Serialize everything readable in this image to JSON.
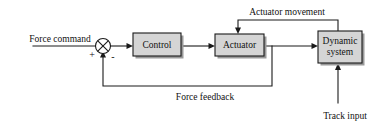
{
  "diagram": {
    "colors": {
      "block_fill": "#d5d5d5",
      "block_border": "#1a1a1a",
      "shadow": "#9a9a9a",
      "wire": "#1a1a1a",
      "background": "#ffffff",
      "text": "#111111"
    },
    "blocks": [
      {
        "id": "control",
        "label": "Control",
        "x": 133,
        "y": 33,
        "w": 48,
        "h": 23
      },
      {
        "id": "actuator",
        "label": "Actuator",
        "x": 215,
        "y": 34,
        "w": 49,
        "h": 22
      },
      {
        "id": "dynamic",
        "label_line1": "Dynamic",
        "label_line2": "system",
        "x": 318,
        "y": 31,
        "w": 44,
        "h": 32
      }
    ],
    "summing_junction": {
      "id": "sum",
      "cx": 103,
      "cy": 46,
      "r": 7.5,
      "glyph": "cross-circle",
      "input_sign_left": "+",
      "input_sign_bottom": "-"
    },
    "labels": {
      "force_command": "Force command",
      "actuator_movement": "Actuator movement",
      "force_feedback": "Force feedback",
      "track_input": "Track input"
    }
  }
}
